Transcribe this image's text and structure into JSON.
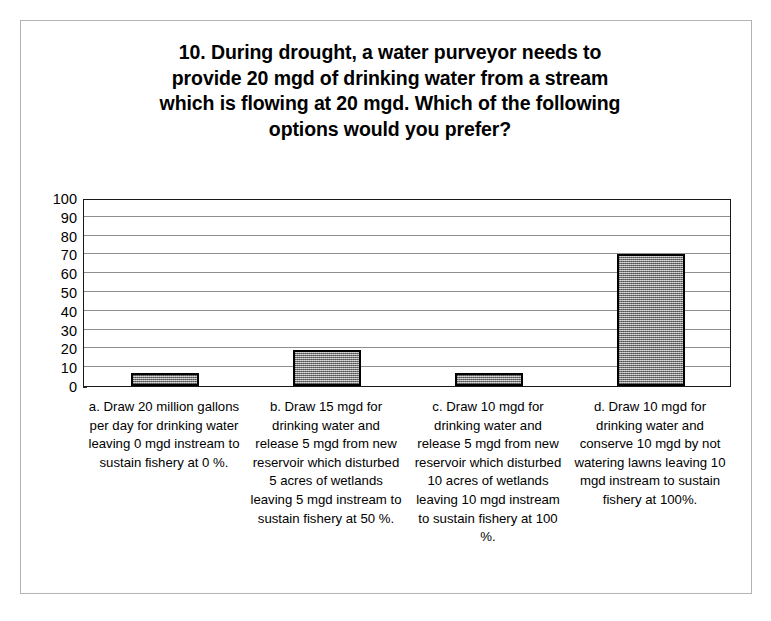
{
  "chart_data": {
    "type": "bar",
    "title": "10. During drought, a water purveyor needs to\nprovide 20 mgd of drinking water from a stream\nwhich is flowing at 20 mgd.  Which of the following\noptions would you prefer?",
    "xlabel": "",
    "ylabel": "",
    "ylim": [
      0,
      100
    ],
    "ytick_labels": [
      "100",
      "90",
      "80",
      "70",
      "60",
      "50",
      "40",
      "30",
      "20",
      "10",
      "0"
    ],
    "ytick_values": [
      100,
      90,
      80,
      70,
      60,
      50,
      40,
      30,
      20,
      10,
      0
    ],
    "grid": "horizontal",
    "legend": "none",
    "categories": [
      "a. Draw 20 million gallons per day for drinking water leaving 0 mgd instream to sustain fishery at 0 %.",
      "b. Draw 15 mgd for drinking water and release 5 mgd from new reservoir which disturbed  5 acres of wetlands leaving 5 mgd instream to sustain fishery at 50 %.",
      "c. Draw 10 mgd for drinking water and release 5 mgd from new reservoir which disturbed 10 acres of wetlands leaving 10 mgd instream to sustain fishery at 100 %.",
      "d. Draw 10 mgd for drinking water and conserve 10 mgd by not watering lawns leaving 10 mgd instream to sustain fishery at 100%."
    ],
    "category_keys": [
      "a",
      "b",
      "c",
      "d"
    ],
    "values": [
      7,
      19,
      7,
      70
    ],
    "bar_fill_color": "#a8a8a8",
    "bar_border_color": "#000000",
    "plot_border_color": "#1a1a1a",
    "gridline_color": "#8e8e8e",
    "frame_color": "#b4b4b4",
    "background_color": "#ffffff"
  }
}
